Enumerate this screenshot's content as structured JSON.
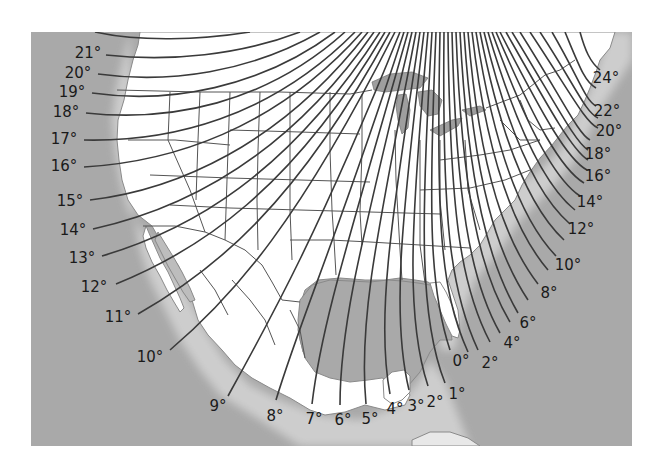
{
  "map": {
    "type": "isogonic-lines",
    "colors": {
      "water": "#a9a9a9",
      "land": "#ffffff",
      "lakes": "#9e9e9e",
      "lines": "#3a3a3a",
      "text": "#1a1a1a",
      "page": "#ffffff"
    },
    "west_labels": [
      {
        "text": "21°",
        "x": 88,
        "y": 58
      },
      {
        "text": "20°",
        "x": 78,
        "y": 78
      },
      {
        "text": "19°",
        "x": 72,
        "y": 97
      },
      {
        "text": "18°",
        "x": 66,
        "y": 117
      },
      {
        "text": "17°",
        "x": 64,
        "y": 144
      },
      {
        "text": "16°",
        "x": 64,
        "y": 171
      },
      {
        "text": "15°",
        "x": 70,
        "y": 206
      },
      {
        "text": "14°",
        "x": 73,
        "y": 235
      },
      {
        "text": "13°",
        "x": 82,
        "y": 263
      },
      {
        "text": "12°",
        "x": 94,
        "y": 292
      },
      {
        "text": "11°",
        "x": 118,
        "y": 322
      },
      {
        "text": "10°",
        "x": 150,
        "y": 362
      }
    ],
    "south_labels": [
      {
        "text": "9°",
        "x": 218,
        "y": 411
      },
      {
        "text": "8°",
        "x": 275,
        "y": 421
      },
      {
        "text": "7°",
        "x": 314,
        "y": 424
      },
      {
        "text": "6°",
        "x": 343,
        "y": 425
      },
      {
        "text": "5°",
        "x": 370,
        "y": 424
      },
      {
        "text": "4°",
        "x": 395,
        "y": 414
      },
      {
        "text": "3°",
        "x": 416,
        "y": 411
      },
      {
        "text": "2°",
        "x": 435,
        "y": 407
      },
      {
        "text": "1°",
        "x": 457,
        "y": 399
      }
    ],
    "east_labels": [
      {
        "text": "0°",
        "x": 461,
        "y": 366
      },
      {
        "text": "2°",
        "x": 490,
        "y": 368
      },
      {
        "text": "4°",
        "x": 512,
        "y": 348
      },
      {
        "text": "6°",
        "x": 528,
        "y": 328
      },
      {
        "text": "8°",
        "x": 549,
        "y": 298
      },
      {
        "text": "10°",
        "x": 568,
        "y": 270
      },
      {
        "text": "12°",
        "x": 581,
        "y": 234
      },
      {
        "text": "14°",
        "x": 590,
        "y": 207
      },
      {
        "text": "16°",
        "x": 598,
        "y": 181
      },
      {
        "text": "18°",
        "x": 598,
        "y": 159
      },
      {
        "text": "20°",
        "x": 609,
        "y": 136
      },
      {
        "text": "22°",
        "x": 607,
        "y": 116
      },
      {
        "text": "24°",
        "x": 606,
        "y": 83
      }
    ]
  }
}
